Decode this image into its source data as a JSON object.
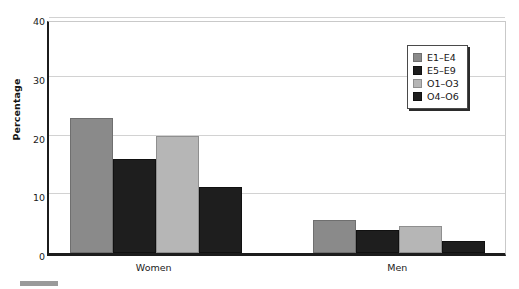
{
  "chart_data": {
    "type": "bar",
    "title": "",
    "xlabel": "",
    "ylabel": "Percentage",
    "ylim": [
      0,
      40
    ],
    "yticks": [
      0,
      10,
      20,
      30,
      40
    ],
    "grid": true,
    "legend_position": "top-right",
    "categories": [
      "Women",
      "Men"
    ],
    "series": [
      {
        "name": "E1–E4",
        "color": "#8a8a8a",
        "values": [
          23.0,
          5.6
        ]
      },
      {
        "name": "E5–E9",
        "color": "#1e1e1e",
        "values": [
          16.0,
          4.0
        ]
      },
      {
        "name": "O1–O3",
        "color": "#b6b6b6",
        "values": [
          20.0,
          4.6
        ]
      },
      {
        "name": "O4–O6",
        "color": "#1e1e1e",
        "values": [
          11.3,
          2.1
        ]
      }
    ]
  },
  "axis": {
    "y_title": "Percentage",
    "y_tick_labels": [
      "0",
      "10",
      "20",
      "30",
      "40"
    ],
    "x_tick_labels": [
      "Women",
      "Men"
    ]
  },
  "legend": {
    "items": [
      {
        "label": "E1–E4"
      },
      {
        "label": "E5–E9"
      },
      {
        "label": "O1–O3"
      },
      {
        "label": "O4–O6"
      }
    ]
  }
}
